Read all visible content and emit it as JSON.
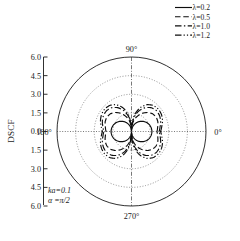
{
  "figure": {
    "axis_title": "DSCF",
    "annotations": [
      "ka=0.1",
      "α =π/2"
    ]
  },
  "legend": {
    "position": "top-right",
    "entries": [
      {
        "label": "λ=0.2",
        "style": "solid",
        "dash": "none"
      },
      {
        "label": "λ=0.5",
        "style": "dashed",
        "dash": "6,3"
      },
      {
        "label": "λ=1.0",
        "style": "dash-dot",
        "dash": "7,2.5,1.5,2.5"
      },
      {
        "label": "λ=1.2",
        "style": "dash-dot-dot",
        "dash": "7,2.2,1.3,2.2,1.3,2.2"
      }
    ]
  },
  "chart_data": {
    "type": "line",
    "projection": "polar",
    "title": "",
    "xlabel": "",
    "ylabel": "DSCF",
    "rlim": [
      0,
      6.0
    ],
    "r_ticks": [
      0.0,
      1.5,
      3.0,
      4.5,
      6.0
    ],
    "r_tick_labels_top": [
      "6.0",
      "4.5",
      "3.0",
      "1.5",
      "0.0"
    ],
    "r_tick_labels_bottom": [
      "1.5",
      "3.0",
      "4.5",
      "6.0"
    ],
    "angle_labels": [
      "0°",
      "90°",
      "180°",
      "270°"
    ],
    "angle_label_positions_deg": [
      0,
      90,
      180,
      270
    ],
    "grid": true,
    "grid_style": "dotted",
    "grid_circles": [
      1.5,
      3.0,
      4.5,
      6.0
    ],
    "legend_position": "upper right",
    "theta_deg": [
      0,
      10,
      20,
      30,
      40,
      50,
      60,
      70,
      80,
      90,
      100,
      110,
      120,
      130,
      140,
      150,
      160,
      170,
      180,
      190,
      200,
      210,
      220,
      230,
      240,
      250,
      260,
      270,
      280,
      290,
      300,
      310,
      320,
      330,
      340,
      350,
      360
    ],
    "series": [
      {
        "name": "λ=0.2",
        "style": "solid",
        "peak": 1.65,
        "r": [
          1.65,
          1.62,
          1.55,
          1.43,
          1.26,
          1.06,
          0.83,
          0.57,
          0.29,
          0.02,
          0.29,
          0.57,
          0.83,
          1.06,
          1.26,
          1.43,
          1.55,
          1.62,
          1.65,
          1.62,
          1.55,
          1.43,
          1.26,
          1.06,
          0.83,
          0.57,
          0.29,
          0.02,
          0.29,
          0.57,
          0.83,
          1.06,
          1.26,
          1.43,
          1.55,
          1.62,
          1.65
        ]
      },
      {
        "name": "λ=0.5",
        "style": "dashed",
        "peak": 2.3,
        "r": [
          2.05,
          2.14,
          2.26,
          2.3,
          2.22,
          2.0,
          1.68,
          1.28,
          0.82,
          0.04,
          0.82,
          1.28,
          1.68,
          2.0,
          2.22,
          2.3,
          2.26,
          2.14,
          2.05,
          2.14,
          2.26,
          2.3,
          2.22,
          2.0,
          1.68,
          1.28,
          0.82,
          0.04,
          0.82,
          1.28,
          1.68,
          2.0,
          2.22,
          2.3,
          2.26,
          2.14,
          2.05
        ]
      },
      {
        "name": "λ=1.0",
        "style": "dash-dot",
        "peak": 2.62,
        "r": [
          2.22,
          2.34,
          2.5,
          2.6,
          2.62,
          2.5,
          2.22,
          1.78,
          1.16,
          0.05,
          1.16,
          1.78,
          2.22,
          2.5,
          2.62,
          2.6,
          2.5,
          2.34,
          2.22,
          2.34,
          2.5,
          2.6,
          2.62,
          2.5,
          2.22,
          1.78,
          1.16,
          0.05,
          1.16,
          1.78,
          2.22,
          2.5,
          2.62,
          2.6,
          2.5,
          2.34,
          2.22
        ]
      },
      {
        "name": "λ=1.2",
        "style": "dash-dot-dot",
        "peak": 2.82,
        "r": [
          2.34,
          2.48,
          2.66,
          2.78,
          2.82,
          2.74,
          2.5,
          2.04,
          1.36,
          0.06,
          1.36,
          2.04,
          2.5,
          2.74,
          2.82,
          2.78,
          2.66,
          2.48,
          2.34,
          2.48,
          2.66,
          2.78,
          2.82,
          2.74,
          2.5,
          2.04,
          1.36,
          0.06,
          1.36,
          2.04,
          2.5,
          2.74,
          2.82,
          2.78,
          2.66,
          2.48,
          2.34
        ]
      }
    ]
  }
}
